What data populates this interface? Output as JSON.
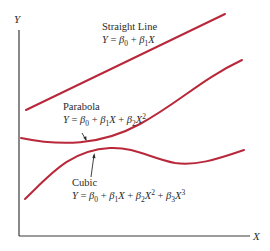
{
  "figure": {
    "axes": {
      "x_label": "X",
      "y_label": "Y"
    },
    "colors": {
      "curve": "#b8283a",
      "axis": "#3a3a3a",
      "text": "#2a2a2a"
    },
    "models": [
      {
        "name": "Straight Line",
        "equation": "Y = β0 + β1X",
        "eq_parts": {
          "y": "Y",
          "eq": " = ",
          "b0": "β",
          "s0": "0",
          "plus1": " + ",
          "b1": "β",
          "s1": "1",
          "x1": "X"
        }
      },
      {
        "name": "Parabola",
        "equation": "Y = β0 + β1X + β2X2",
        "eq_parts": {
          "y": "Y",
          "eq": " = ",
          "b0": "β",
          "s0": "0",
          "plus1": " + ",
          "b1": "β",
          "s1": "1",
          "x1": "X",
          "plus2": " + ",
          "b2": "β",
          "s2": "2",
          "x2": "X",
          "p2": "2"
        }
      },
      {
        "name": "Cubic",
        "equation": "Y = β0 + β1X + β2X2 + β3X3",
        "eq_parts": {
          "y": "Y",
          "eq": " = ",
          "b0": "β",
          "s0": "0",
          "plus1": " + ",
          "b1": "β",
          "s1": "1",
          "x1": "X",
          "plus2": " + ",
          "b2": "β",
          "s2": "2",
          "x2": "X",
          "p2": "2",
          "plus3": " + ",
          "b3": "β",
          "s3": "3",
          "x3": "X",
          "p3": "3"
        }
      }
    ]
  }
}
